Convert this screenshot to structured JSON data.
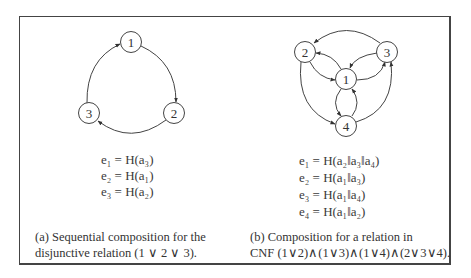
{
  "subfigures": [
    {
      "id": "a",
      "nodes": [
        {
          "label": "1",
          "x": 131,
          "y": 42
        },
        {
          "label": "2",
          "x": 174,
          "y": 113
        },
        {
          "label": "3",
          "x": 89,
          "y": 113
        }
      ],
      "edges": [
        {
          "from": "1",
          "to": "2"
        },
        {
          "from": "2",
          "to": "3"
        },
        {
          "from": "3",
          "to": "1"
        }
      ],
      "equations": [
        "e₁ = H(a₃)",
        "e₂ = H(a₁)",
        "e₃ = H(a₂)"
      ],
      "caption_lines": [
        "(a) Sequential composition for the",
        "disjunctive relation (1 ∨ 2 ∨ 3)."
      ]
    },
    {
      "id": "b",
      "nodes": [
        {
          "label": "1",
          "x": 346,
          "y": 79
        },
        {
          "label": "2",
          "x": 305,
          "y": 52
        },
        {
          "label": "3",
          "x": 387,
          "y": 52
        },
        {
          "label": "4",
          "x": 346,
          "y": 126
        }
      ],
      "edges": [
        {
          "from": "3",
          "to": "2"
        },
        {
          "from": "1",
          "to": "2"
        },
        {
          "from": "2",
          "to": "1"
        },
        {
          "from": "3",
          "to": "1"
        },
        {
          "from": "1",
          "to": "3"
        },
        {
          "from": "2",
          "to": "4"
        },
        {
          "from": "1",
          "to": "4"
        },
        {
          "from": "4",
          "to": "1"
        },
        {
          "from": "4",
          "to": "3"
        }
      ],
      "equations": [
        "e₁ = H(a₂‖a₃‖a₄)",
        "e₂ = H(a₁‖a₃)",
        "e₃ = H(a₁‖a₄)",
        "e₄ = H(a₁‖a₂)"
      ],
      "caption_lines": [
        "(b) Composition for a relation in",
        "CNF (1∨2)∧(1∨3)∧(1∨4)∧(2∨3∨4)."
      ]
    }
  ]
}
